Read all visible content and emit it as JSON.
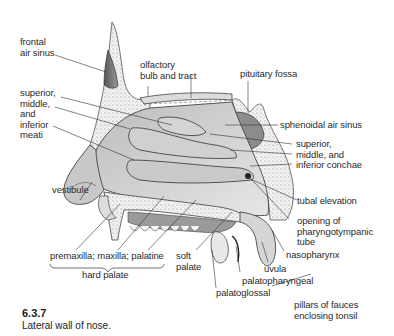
{
  "figure": {
    "number": "6.3.7",
    "caption": "Lateral wall of nose."
  },
  "labels": {
    "frontal_air_sinus": [
      "frontal",
      "air sinus"
    ],
    "olfactory": [
      "olfactory",
      "bulb and tract"
    ],
    "pituitary_fossa": "pituitary fossa",
    "meati": [
      "superior,",
      "middle,",
      "and",
      "inferior",
      "meati"
    ],
    "sphenoidal_air_sinus": "sphenoidal air sinus",
    "conchae": [
      "superior,",
      "middle, and",
      "inferior conchae"
    ],
    "vestibule": "vestibule",
    "tubal_elevation": "tubal elevation",
    "pharyngotympanic": [
      "opening of",
      "pharyngotympanic",
      "tube"
    ],
    "nasopharynx": "nasopharynx",
    "uvula": "uvula",
    "palatopharyngeal": "palatopharyngeal",
    "palatoglossal": "palatoglossal",
    "pillars": [
      "pillars of fauces",
      "enclosing tonsil"
    ],
    "hard_palate_parts": "premaxilla; maxilla; palatine",
    "hard_palate": "hard palate",
    "soft_palate": [
      "soft",
      "palate"
    ]
  }
}
